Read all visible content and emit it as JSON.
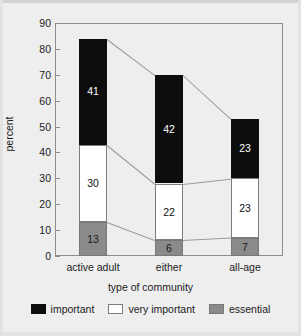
{
  "chart_data": {
    "type": "bar",
    "subtype": "stacked-bar-100-partial",
    "title": "",
    "xlabel": "type of community",
    "ylabel": "percent",
    "ylim": [
      0,
      90
    ],
    "yticks": [
      0,
      10,
      20,
      30,
      40,
      50,
      60,
      70,
      80,
      90
    ],
    "ytick_labels": [
      "0",
      "10",
      "20",
      "30",
      "40",
      "50",
      "60",
      "70",
      "80",
      "90"
    ],
    "categories": [
      "active adult",
      "either",
      "all-age"
    ],
    "grid": false,
    "legend_position": "bottom",
    "stack_order_bottom_to_top": [
      "essential",
      "very important",
      "important"
    ],
    "series": [
      {
        "name": "essential",
        "color": "#8a8a8a",
        "values": [
          13,
          6,
          7
        ]
      },
      {
        "name": "very important",
        "color": "#ffffff",
        "values": [
          30,
          22,
          23
        ]
      },
      {
        "name": "important",
        "color": "#0d0d0d",
        "values": [
          41,
          42,
          23
        ]
      }
    ],
    "totals": [
      84,
      70,
      53
    ],
    "data_labels": [
      {
        "category": "active adult",
        "essential": "13",
        "very_important": "30",
        "important": "41"
      },
      {
        "category": "either",
        "essential": "6",
        "very_important": "22",
        "important": "42"
      },
      {
        "category": "all-age",
        "essential": "7",
        "very_important": "23",
        "important": "23"
      }
    ],
    "connector_lines": true,
    "legend": [
      {
        "label": "important",
        "color": "#0d0d0d"
      },
      {
        "label": "very important",
        "color": "#ffffff"
      },
      {
        "label": "essential",
        "color": "#8a8a8a"
      }
    ]
  },
  "figure": {
    "background": "#eeeeee",
    "frame_color": "#8d8d8d"
  }
}
